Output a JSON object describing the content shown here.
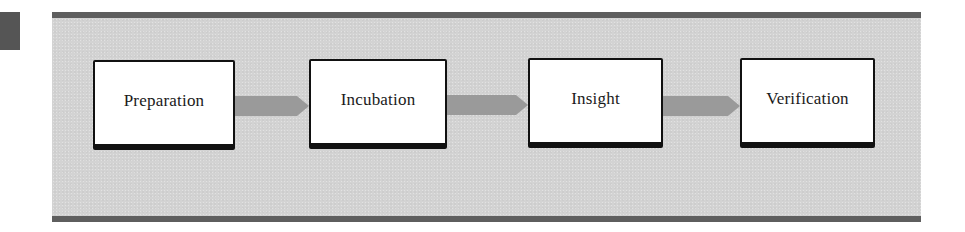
{
  "diagram": {
    "type": "process-flow",
    "stages": [
      {
        "label": "Preparation"
      },
      {
        "label": "Incubation"
      },
      {
        "label": "Insight"
      },
      {
        "label": "Verification"
      }
    ],
    "connectors": [
      {
        "from": "Preparation",
        "to": "Incubation"
      },
      {
        "from": "Incubation",
        "to": "Insight"
      },
      {
        "from": "Insight",
        "to": "Verification"
      }
    ],
    "colors": {
      "panel_background": "#d3d3d3",
      "panel_bars": "#5e5e5e",
      "marker": "#555555",
      "box_fill": "#ffffff",
      "box_border": "#111111",
      "arrow_fill": "#9a9a9a"
    }
  }
}
